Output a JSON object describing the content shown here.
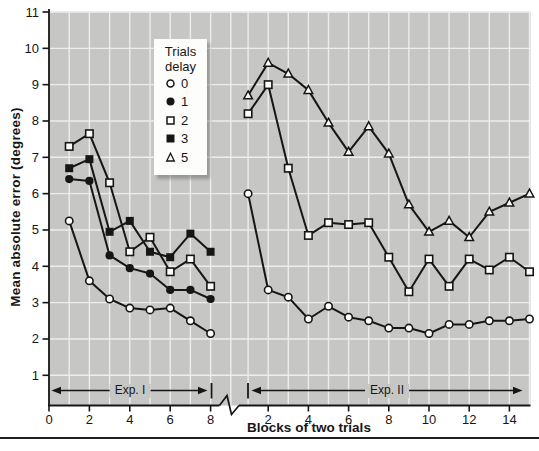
{
  "figure": {
    "y_axis_title": "Mean absolute error (degrees)",
    "x_axis_title": "Blocks of two trials"
  },
  "legend": {
    "title_line1": "Trials",
    "title_line2": "delay",
    "items": [
      {
        "marker": "circle-open",
        "label": "0"
      },
      {
        "marker": "circle-filled",
        "label": "1"
      },
      {
        "marker": "square-open",
        "label": "2"
      },
      {
        "marker": "square-filled",
        "label": "3"
      },
      {
        "marker": "triangle-open",
        "label": "5"
      }
    ]
  },
  "annotations": {
    "exp1": "Exp. I",
    "exp2": "Exp. II"
  },
  "colors": {
    "ink": "#161616",
    "plot_bg": "#c6c6c4",
    "grid": "#edeeec",
    "legend_bg": "#fdfdfc",
    "bottom_rule": "#1e1e1e",
    "marker_open_fill": "#ffffff"
  },
  "chart_data": {
    "type": "line",
    "title": "",
    "xlabel": "Blocks of two trials",
    "ylabel": "Mean absolute error (degrees)",
    "ylim": [
      1,
      11
    ],
    "y_ticks": [
      1,
      2,
      3,
      4,
      5,
      6,
      7,
      8,
      9,
      10,
      11
    ],
    "grid": true,
    "legend_position": "upper-left-inside",
    "axis_break_between_panels": true,
    "panels": [
      {
        "name": "Exp. I",
        "x_ticks": [
          0,
          2,
          4,
          6,
          8
        ],
        "xlim": [
          0,
          8.4
        ],
        "x": [
          1,
          2,
          3,
          4,
          5,
          6,
          7,
          8
        ],
        "series": [
          {
            "name": "delay 0",
            "marker": "circle-open",
            "values": [
              5.25,
              3.6,
              3.1,
              2.85,
              2.8,
              2.85,
              2.5,
              2.15
            ]
          },
          {
            "name": "delay 1",
            "marker": "circle-filled",
            "values": [
              6.4,
              6.35,
              4.3,
              3.95,
              3.8,
              3.35,
              3.35,
              3.1
            ]
          },
          {
            "name": "delay 2",
            "marker": "square-open",
            "values": [
              7.3,
              7.65,
              6.3,
              4.4,
              4.8,
              3.85,
              4.2,
              3.45
            ]
          },
          {
            "name": "delay 3",
            "marker": "square-filled",
            "values": [
              6.7,
              6.95,
              4.95,
              5.25,
              4.4,
              4.25,
              4.9,
              4.4
            ]
          }
        ]
      },
      {
        "name": "Exp. II",
        "x_ticks": [
          2,
          4,
          6,
          8,
          10,
          12,
          14
        ],
        "xlim": [
          1,
          15
        ],
        "x": [
          1,
          2,
          3,
          4,
          5,
          6,
          7,
          8,
          9,
          10,
          11,
          12,
          13,
          14,
          15
        ],
        "series": [
          {
            "name": "delay 0",
            "marker": "circle-open",
            "values": [
              6.0,
              3.35,
              3.15,
              2.55,
              2.9,
              2.6,
              2.5,
              2.3,
              2.3,
              2.15,
              2.4,
              2.4,
              2.5,
              2.5,
              2.55
            ]
          },
          {
            "name": "delay 2",
            "marker": "square-open",
            "values": [
              8.2,
              9.0,
              6.7,
              4.85,
              5.2,
              5.15,
              5.2,
              4.25,
              3.3,
              4.2,
              3.45,
              4.2,
              3.9,
              4.25,
              3.85
            ]
          },
          {
            "name": "delay 5",
            "marker": "triangle-open",
            "values": [
              8.7,
              9.6,
              9.3,
              8.85,
              7.95,
              7.15,
              7.85,
              7.1,
              5.7,
              4.95,
              5.25,
              4.8,
              5.5,
              5.75,
              6.0
            ]
          }
        ]
      }
    ]
  }
}
